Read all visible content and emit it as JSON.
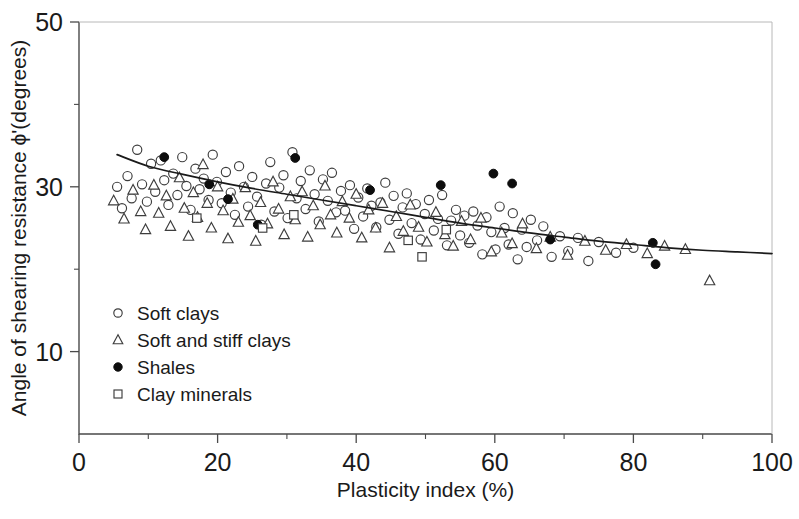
{
  "chart_data": {
    "type": "scatter",
    "title": "",
    "xlabel": "Plasticity index (%)",
    "ylabel": "Angle of shearing resistance ϕ'(degrees)",
    "xlim": [
      0,
      100
    ],
    "ylim": [
      0,
      50
    ],
    "grid": false,
    "x_ticks": [
      0,
      20,
      40,
      60,
      80,
      100
    ],
    "x_ticklabels": [
      "0",
      "20",
      "40",
      "60",
      "80",
      "100"
    ],
    "x_minor_ticks": [
      10,
      30,
      50,
      70,
      90
    ],
    "y_ticks": [
      10,
      30,
      50
    ],
    "y_ticklabels": [
      "10",
      "30",
      "50"
    ],
    "y_minor_ticks": [
      20,
      40
    ],
    "legend_position": "lower-left-inside",
    "series": [
      {
        "name": "Soft clays",
        "marker": "open-circle",
        "points": [
          [
            5.5,
            30.0
          ],
          [
            6.2,
            27.4
          ],
          [
            7.0,
            31.3
          ],
          [
            7.6,
            28.6
          ],
          [
            8.4,
            34.5
          ],
          [
            9.1,
            30.3
          ],
          [
            9.8,
            28.2
          ],
          [
            10.4,
            32.8
          ],
          [
            11.0,
            29.4
          ],
          [
            11.8,
            33.2
          ],
          [
            12.3,
            30.8
          ],
          [
            12.9,
            27.8
          ],
          [
            13.6,
            31.6
          ],
          [
            14.2,
            29.0
          ],
          [
            14.9,
            33.6
          ],
          [
            15.5,
            30.1
          ],
          [
            16.1,
            27.2
          ],
          [
            16.8,
            32.2
          ],
          [
            17.4,
            29.7
          ],
          [
            18.0,
            31.0
          ],
          [
            18.7,
            28.4
          ],
          [
            19.3,
            33.9
          ],
          [
            19.9,
            30.6
          ],
          [
            20.6,
            28.0
          ],
          [
            21.2,
            31.8
          ],
          [
            21.9,
            29.3
          ],
          [
            22.5,
            26.6
          ],
          [
            23.1,
            32.5
          ],
          [
            23.8,
            30.0
          ],
          [
            24.4,
            27.6
          ],
          [
            25.0,
            31.2
          ],
          [
            25.7,
            28.8
          ],
          [
            26.3,
            25.4
          ],
          [
            27.0,
            30.4
          ],
          [
            27.6,
            33.0
          ],
          [
            28.2,
            27.0
          ],
          [
            28.9,
            29.9
          ],
          [
            29.5,
            31.4
          ],
          [
            30.1,
            26.2
          ],
          [
            30.8,
            34.2
          ],
          [
            31.4,
            28.6
          ],
          [
            32.0,
            30.7
          ],
          [
            32.7,
            27.3
          ],
          [
            33.3,
            32.0
          ],
          [
            34.0,
            29.1
          ],
          [
            34.6,
            25.8
          ],
          [
            35.2,
            30.9
          ],
          [
            35.9,
            28.3
          ],
          [
            36.5,
            31.7
          ],
          [
            37.1,
            26.9
          ],
          [
            37.8,
            29.5
          ],
          [
            38.4,
            27.1
          ],
          [
            39.1,
            30.2
          ],
          [
            39.7,
            24.9
          ],
          [
            40.3,
            28.7
          ],
          [
            41.0,
            26.4
          ],
          [
            41.6,
            29.8
          ],
          [
            42.2,
            27.7
          ],
          [
            42.9,
            25.1
          ],
          [
            43.5,
            28.1
          ],
          [
            44.2,
            30.5
          ],
          [
            44.8,
            26.0
          ],
          [
            45.4,
            28.9
          ],
          [
            46.1,
            24.3
          ],
          [
            46.7,
            27.5
          ],
          [
            47.3,
            29.2
          ],
          [
            48.0,
            25.6
          ],
          [
            48.6,
            27.9
          ],
          [
            49.3,
            23.6
          ],
          [
            49.9,
            26.7
          ],
          [
            50.5,
            28.4
          ],
          [
            51.2,
            24.7
          ],
          [
            51.8,
            26.1
          ],
          [
            52.4,
            29.0
          ],
          [
            53.1,
            22.9
          ],
          [
            53.7,
            25.9
          ],
          [
            54.4,
            27.2
          ],
          [
            55.0,
            24.1
          ],
          [
            55.6,
            26.5
          ],
          [
            56.3,
            23.2
          ],
          [
            56.9,
            27.0
          ],
          [
            57.5,
            25.3
          ],
          [
            58.2,
            21.8
          ],
          [
            58.8,
            26.3
          ],
          [
            59.5,
            24.5
          ],
          [
            60.1,
            22.4
          ],
          [
            60.7,
            27.6
          ],
          [
            61.4,
            25.0
          ],
          [
            62.0,
            23.0
          ],
          [
            62.6,
            26.8
          ],
          [
            63.3,
            21.2
          ],
          [
            63.9,
            24.8
          ],
          [
            64.6,
            22.7
          ],
          [
            65.2,
            26.0
          ],
          [
            66.1,
            23.5
          ],
          [
            67.0,
            25.2
          ],
          [
            68.2,
            21.5
          ],
          [
            69.4,
            24.0
          ],
          [
            70.6,
            22.2
          ],
          [
            72.0,
            23.8
          ],
          [
            73.5,
            21.0
          ],
          [
            75.0,
            23.3
          ],
          [
            77.5,
            22.0
          ],
          [
            80.0,
            22.6
          ]
        ]
      },
      {
        "name": "Soft and stiff clays",
        "marker": "open-triangle",
        "points": [
          [
            5.0,
            28.3
          ],
          [
            6.5,
            26.1
          ],
          [
            7.8,
            29.6
          ],
          [
            8.9,
            27.0
          ],
          [
            9.6,
            24.8
          ],
          [
            10.8,
            30.2
          ],
          [
            11.5,
            26.8
          ],
          [
            12.6,
            28.9
          ],
          [
            13.2,
            25.2
          ],
          [
            14.5,
            31.1
          ],
          [
            15.2,
            27.4
          ],
          [
            15.8,
            24.0
          ],
          [
            16.5,
            29.3
          ],
          [
            17.1,
            26.3
          ],
          [
            17.9,
            32.7
          ],
          [
            18.5,
            28.0
          ],
          [
            19.1,
            25.0
          ],
          [
            20.0,
            30.0
          ],
          [
            20.8,
            27.1
          ],
          [
            21.5,
            23.7
          ],
          [
            22.2,
            28.5
          ],
          [
            23.0,
            25.7
          ],
          [
            24.0,
            29.9
          ],
          [
            24.7,
            26.5
          ],
          [
            25.5,
            23.4
          ],
          [
            26.2,
            28.1
          ],
          [
            27.2,
            25.5
          ],
          [
            28.0,
            30.6
          ],
          [
            28.8,
            27.3
          ],
          [
            29.6,
            24.2
          ],
          [
            30.5,
            28.8
          ],
          [
            31.2,
            26.0
          ],
          [
            32.2,
            29.4
          ],
          [
            33.0,
            23.9
          ],
          [
            33.8,
            27.7
          ],
          [
            34.8,
            25.4
          ],
          [
            35.5,
            30.1
          ],
          [
            36.3,
            26.6
          ],
          [
            37.2,
            24.4
          ],
          [
            38.0,
            28.2
          ],
          [
            39.0,
            26.2
          ],
          [
            40.0,
            29.1
          ],
          [
            40.8,
            23.8
          ],
          [
            41.8,
            27.2
          ],
          [
            42.8,
            25.0
          ],
          [
            43.8,
            28.0
          ],
          [
            44.8,
            22.6
          ],
          [
            45.8,
            26.4
          ],
          [
            46.8,
            24.6
          ],
          [
            47.8,
            27.8
          ],
          [
            49.0,
            25.1
          ],
          [
            50.2,
            23.3
          ],
          [
            51.5,
            26.9
          ],
          [
            52.8,
            24.2
          ],
          [
            54.0,
            22.8
          ],
          [
            55.2,
            25.8
          ],
          [
            56.5,
            23.6
          ],
          [
            58.0,
            26.2
          ],
          [
            59.5,
            22.1
          ],
          [
            61.0,
            24.4
          ],
          [
            62.5,
            23.1
          ],
          [
            64.0,
            25.5
          ],
          [
            66.0,
            22.5
          ],
          [
            68.0,
            23.9
          ],
          [
            70.5,
            21.7
          ],
          [
            73.0,
            23.4
          ],
          [
            76.0,
            22.3
          ],
          [
            79.0,
            23.0
          ],
          [
            82.0,
            21.9
          ],
          [
            84.5,
            22.8
          ],
          [
            87.5,
            22.4
          ],
          [
            91.0,
            18.6
          ]
        ]
      },
      {
        "name": "Shales",
        "marker": "filled-circle",
        "points": [
          [
            12.3,
            33.6
          ],
          [
            18.8,
            30.3
          ],
          [
            21.5,
            28.5
          ],
          [
            25.8,
            25.4
          ],
          [
            31.2,
            33.5
          ],
          [
            42.0,
            29.6
          ],
          [
            52.2,
            30.2
          ],
          [
            59.8,
            31.6
          ],
          [
            62.5,
            30.4
          ],
          [
            68.0,
            23.6
          ],
          [
            82.8,
            23.2
          ],
          [
            83.2,
            20.6
          ]
        ]
      },
      {
        "name": "Clay minerals",
        "marker": "open-square",
        "points": [
          [
            17.0,
            26.2
          ],
          [
            26.5,
            25.0
          ],
          [
            31.0,
            26.6
          ],
          [
            47.5,
            23.5
          ],
          [
            49.5,
            21.5
          ],
          [
            53.0,
            24.8
          ]
        ]
      }
    ],
    "trend_line": {
      "name": "fitted-trend",
      "points": [
        [
          5.5,
          33.9
        ],
        [
          10,
          32.5
        ],
        [
          15,
          31.5
        ],
        [
          20,
          30.6
        ],
        [
          25,
          29.8
        ],
        [
          30,
          29.1
        ],
        [
          35,
          28.4
        ],
        [
          40,
          27.7
        ],
        [
          45,
          27.0
        ],
        [
          50,
          26.3
        ],
        [
          55,
          25.6
        ],
        [
          60,
          25.0
        ],
        [
          65,
          24.4
        ],
        [
          70,
          23.9
        ],
        [
          75,
          23.4
        ],
        [
          80,
          23.0
        ],
        [
          85,
          22.6
        ],
        [
          90,
          22.3
        ],
        [
          95,
          22.1
        ],
        [
          100,
          21.9
        ]
      ]
    }
  },
  "legend": {
    "items": [
      {
        "label": "Soft clays",
        "marker": "open-circle"
      },
      {
        "label": "Soft and stiff clays",
        "marker": "open-triangle"
      },
      {
        "label": "Shales",
        "marker": "filled-circle"
      },
      {
        "label": "Clay minerals",
        "marker": "open-square"
      }
    ]
  }
}
